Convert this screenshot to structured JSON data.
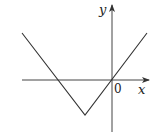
{
  "diagram": {
    "type": "function-graph",
    "axes": {
      "x_label": "x",
      "y_label": "y",
      "origin_label": "0"
    },
    "colors": {
      "line": "#333333",
      "axis": "#444444",
      "background": "#ffffff"
    },
    "geometry": {
      "origin": [
        112,
        80
      ],
      "vertex": [
        85,
        115
      ],
      "left_end": [
        22,
        33
      ],
      "right_end": [
        147,
        33
      ],
      "x_axis": {
        "from": [
          22,
          80
        ],
        "to": [
          150,
          80
        ]
      },
      "y_axis": {
        "from": [
          112,
          132
        ],
        "to": [
          112,
          3
        ]
      }
    }
  }
}
